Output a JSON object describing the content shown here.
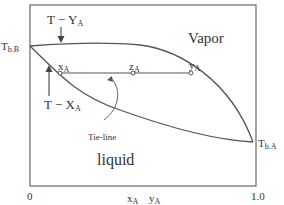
{
  "diagram": {
    "type": "T-x-y phase diagram (binary, boiling point)",
    "regions": {
      "vapor": "Vapor",
      "liquid": "liquid"
    },
    "curves": {
      "dew_curve_label": "T − Y",
      "dew_curve_sub": "A",
      "bubble_curve_label": "T − X",
      "bubble_curve_sub": "A"
    },
    "points": {
      "tbb_main": "T",
      "tbb_sub": "b.B",
      "tba_main": "T",
      "tba_sub": "b.A",
      "xa_main": "x",
      "xa_sub": "A",
      "za_main": "z",
      "za_sub": "A",
      "ya_main": "y",
      "ya_sub": "A"
    },
    "tie_line_label": "Tie-line",
    "axis": {
      "x_min": "0",
      "x_max": "1.0",
      "x_label_1_main": "x",
      "x_label_1_sub": "A",
      "x_label_2_main": "y",
      "x_label_2_sub": "A"
    },
    "colors": {
      "line": "#555555",
      "text": "#333333",
      "background": "#ffffff"
    }
  }
}
